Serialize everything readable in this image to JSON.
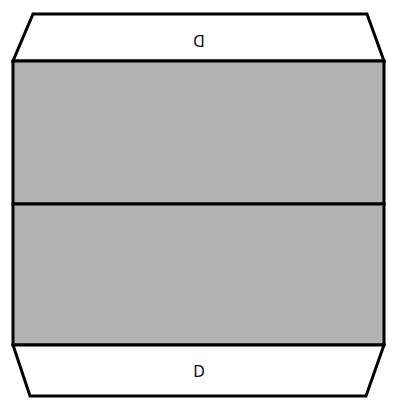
{
  "diagram": {
    "colors": {
      "panel_fill": "#b3b3b3",
      "flap_fill": "#ffffff",
      "stroke": "#000000"
    },
    "top_flap": {
      "label": "D",
      "orientation": "rotated-180"
    },
    "bottom_flap": {
      "label": "D",
      "orientation": "upright"
    },
    "panels": [
      {
        "name": "upper-panel"
      },
      {
        "name": "lower-panel"
      }
    ]
  }
}
